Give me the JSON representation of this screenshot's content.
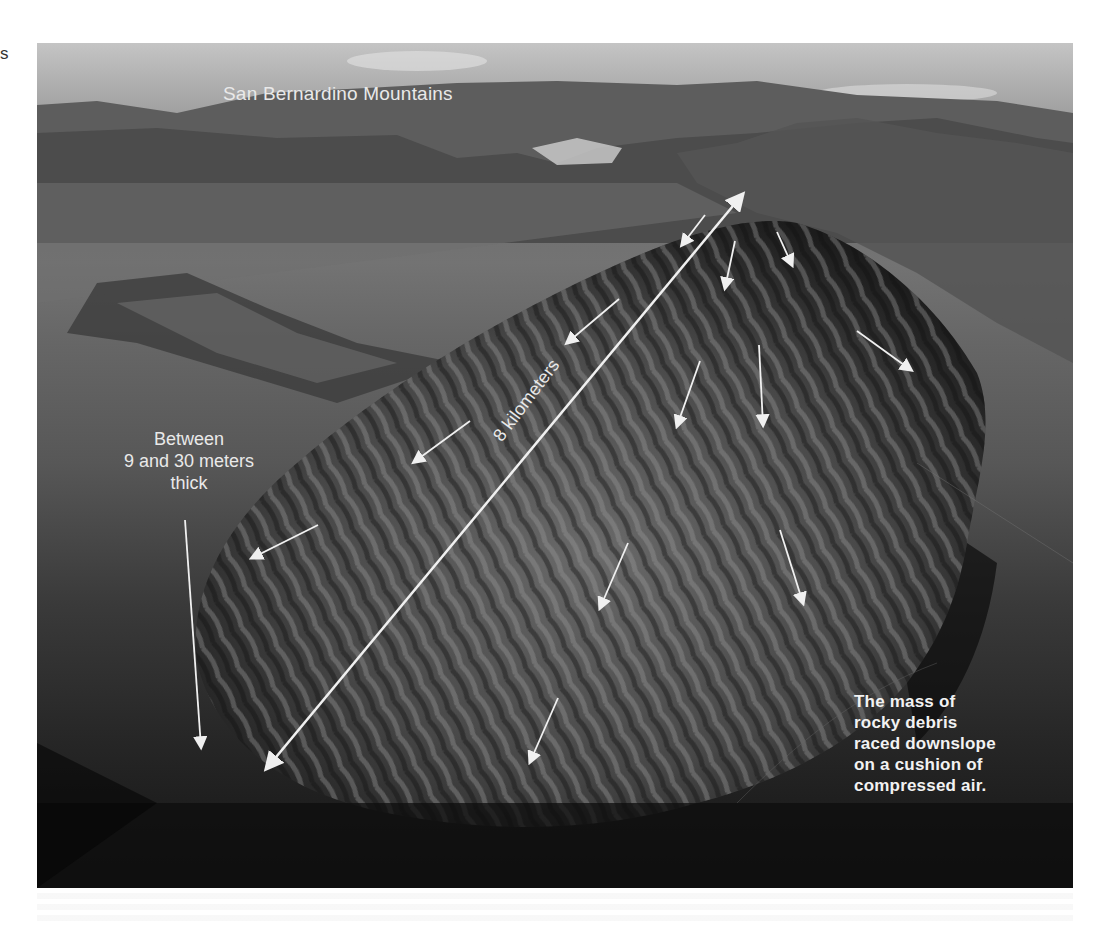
{
  "page": {
    "margin_fragment": "s"
  },
  "photo": {
    "description": "Aerial black-and-white photograph of a large rock-avalanche (debris) deposit at the foot of a mountain range",
    "labels": {
      "mountains": "San Bernardino Mountains",
      "thickness_lines": [
        "Between",
        "9 and 30 meters",
        "thick"
      ],
      "distance": "8 kilometers",
      "caption_lines": [
        "The mass of",
        "rocky debris",
        "raced downslope",
        "on a cushion of",
        "compressed air."
      ]
    },
    "colors": {
      "annotation": "#e9e9e9",
      "sky": "#bdbdbd",
      "deposit_dark": "#141414"
    },
    "arrows": {
      "distance_double_arrow": {
        "from": [
          230,
          725
        ],
        "to": [
          705,
          152
        ]
      },
      "thickness_arrow": {
        "from": [
          148,
          477
        ],
        "to": [
          164,
          704
        ]
      },
      "flow_arrows": [
        {
          "from": [
            668,
            172
          ],
          "to": [
            645,
            202
          ]
        },
        {
          "from": [
            698,
            198
          ],
          "to": [
            688,
            245
          ]
        },
        {
          "from": [
            740,
            189
          ],
          "to": [
            755,
            222
          ]
        },
        {
          "from": [
            582,
            256
          ],
          "to": [
            530,
            300
          ]
        },
        {
          "from": [
            663,
            318
          ],
          "to": [
            640,
            383
          ]
        },
        {
          "from": [
            722,
            302
          ],
          "to": [
            726,
            382
          ]
        },
        {
          "from": [
            820,
            288
          ],
          "to": [
            874,
            327
          ]
        },
        {
          "from": [
            433,
            378
          ],
          "to": [
            377,
            419
          ]
        },
        {
          "from": [
            281,
            482
          ],
          "to": [
            215,
            515
          ]
        },
        {
          "from": [
            591,
            500
          ],
          "to": [
            563,
            565
          ]
        },
        {
          "from": [
            743,
            487
          ],
          "to": [
            766,
            560
          ]
        },
        {
          "from": [
            521,
            655
          ],
          "to": [
            493,
            719
          ]
        }
      ]
    }
  }
}
